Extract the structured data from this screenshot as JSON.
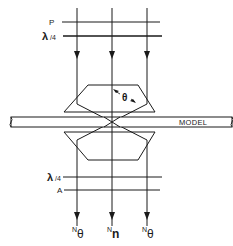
{
  "diagram": {
    "colors": {
      "line": "#1a1a1a",
      "background": "#ffffff"
    },
    "top_labels": {
      "polarizer": "P",
      "quarter_wave": {
        "symbol": "λ",
        "fraction": "/4"
      }
    },
    "bottom_labels": {
      "quarter_wave": {
        "symbol": "λ",
        "fraction": "/4"
      },
      "analyzer": "A"
    },
    "angle_label": "θ",
    "model_label": "MODEL",
    "outputs": [
      {
        "superscript": "N",
        "symbol": "θ"
      },
      {
        "superscript": "N",
        "symbol": "n"
      },
      {
        "superscript": "N",
        "symbol": "θ"
      }
    ]
  }
}
